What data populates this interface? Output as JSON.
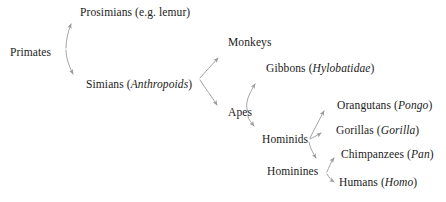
{
  "diagram": {
    "type": "phylogenetic-tree",
    "line_color": "#9a9a9a",
    "text_color": "#1b1b1b",
    "background_color": "#ffffff",
    "nodes": [
      {
        "id": "primates",
        "label": "Primates",
        "sci": "",
        "x": 10,
        "y": 46
      },
      {
        "id": "prosimians",
        "label": "Prosimians",
        "sci": "e.g. lemur",
        "x": 80,
        "y": 6,
        "sci_italic": false
      },
      {
        "id": "simians",
        "label": "Simians",
        "sci": "Anthropoids",
        "x": 86,
        "y": 78,
        "sci_italic": true
      },
      {
        "id": "monkeys",
        "label": "Monkeys",
        "sci": "",
        "x": 228,
        "y": 36
      },
      {
        "id": "apes",
        "label": "Apes",
        "sci": "",
        "x": 228,
        "y": 106
      },
      {
        "id": "gibbons",
        "label": "Gibbons",
        "sci": "Hylobatidae",
        "x": 266,
        "y": 62,
        "sci_italic": true
      },
      {
        "id": "hominids",
        "label": "Hominids",
        "sci": "",
        "x": 262,
        "y": 133
      },
      {
        "id": "hominines",
        "label": "Hominines",
        "sci": "",
        "x": 267,
        "y": 165
      },
      {
        "id": "orangutans",
        "label": "Orangutans",
        "sci": "Pongo",
        "x": 337,
        "y": 99,
        "sci_italic": true
      },
      {
        "id": "gorillas",
        "label": "Gorillas",
        "sci": "Gorilla",
        "x": 336,
        "y": 124,
        "sci_italic": true
      },
      {
        "id": "chimpanzees",
        "label": "Chimpanzees",
        "sci": "Pan",
        "x": 341,
        "y": 148,
        "sci_italic": true
      },
      {
        "id": "humans",
        "label": "Humans",
        "sci": "Homo",
        "x": 339,
        "y": 176,
        "sci_italic": true
      }
    ],
    "edges": [
      {
        "from": "primates",
        "to": "prosimians"
      },
      {
        "from": "primates",
        "to": "simians"
      },
      {
        "from": "simians",
        "to": "monkeys"
      },
      {
        "from": "simians",
        "to": "apes"
      },
      {
        "from": "apes",
        "to": "gibbons"
      },
      {
        "from": "apes",
        "to": "hominids"
      },
      {
        "from": "hominids",
        "to": "orangutans"
      },
      {
        "from": "hominids",
        "to": "gorillas"
      },
      {
        "from": "hominids",
        "to": "hominines"
      },
      {
        "from": "hominines",
        "to": "chimpanzees"
      },
      {
        "from": "hominines",
        "to": "humans"
      }
    ]
  }
}
